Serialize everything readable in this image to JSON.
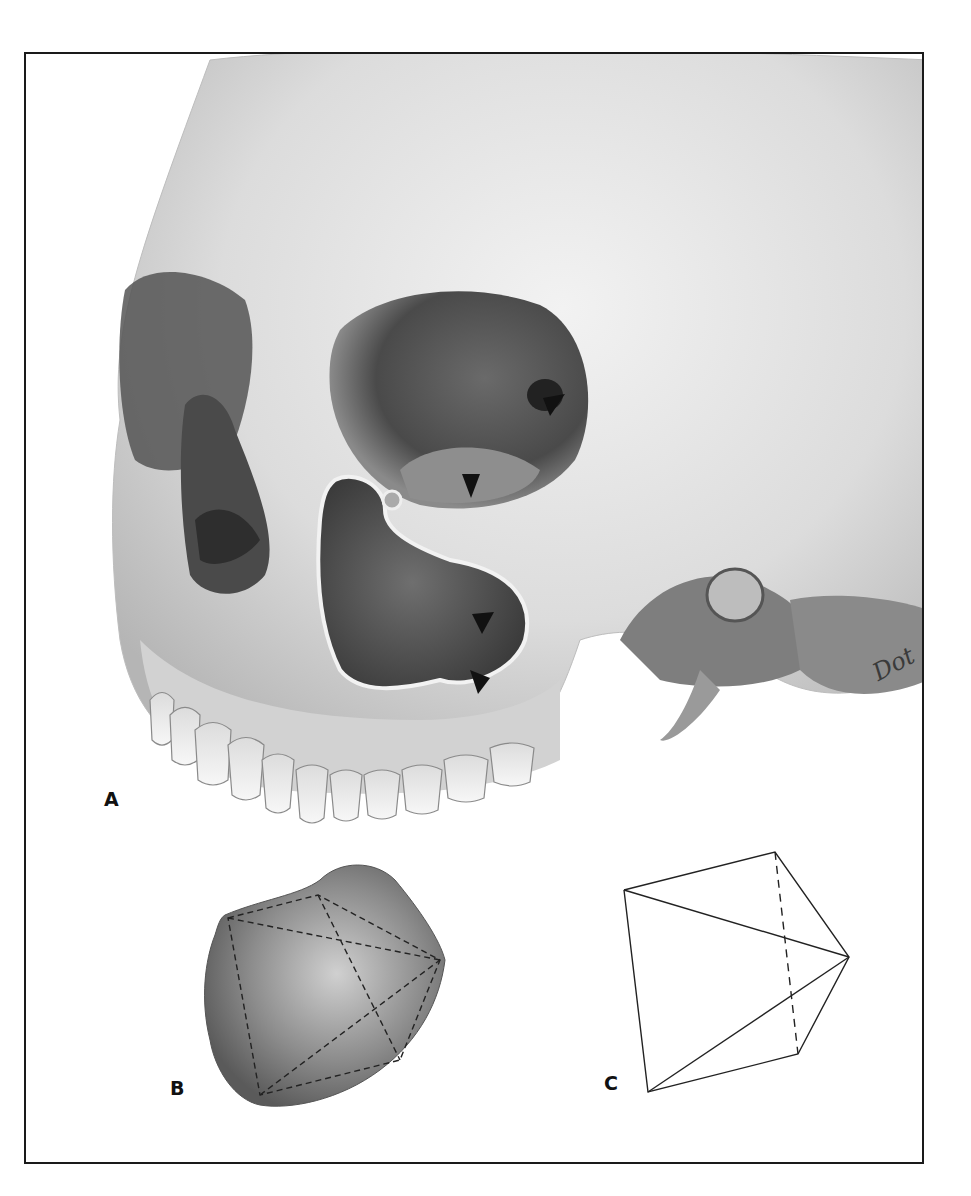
{
  "figure": {
    "panels": [
      {
        "id": "A",
        "label": "A",
        "subject": "skull, anterolateral view with opened maxillary sinus"
      },
      {
        "id": "B",
        "label": "B",
        "subject": "sinus cast with inscribed dashed pyramid outline"
      },
      {
        "id": "C",
        "label": "C",
        "subject": "pyramid line diagram"
      }
    ],
    "signature": "Dot",
    "arrowheads": [
      {
        "x": 470,
        "y": 487
      },
      {
        "x": 552,
        "y": 405
      },
      {
        "x": 484,
        "y": 624
      },
      {
        "x": 480,
        "y": 683
      }
    ],
    "pyramid_vertices": {
      "top_left": [
        624,
        890
      ],
      "top_right": [
        775,
        852
      ],
      "apex_right": [
        849,
        957
      ],
      "bottom_right": [
        798,
        1054
      ],
      "bottom_left": [
        648,
        1092
      ]
    },
    "colors": {
      "ink": "#111111",
      "bone_light": "#e6e6e6",
      "bone_mid": "#b8b8b8",
      "shadow": "#4a4a4a",
      "deep_shadow": "#2a2a2a",
      "frame": "#1a1a1a"
    }
  }
}
